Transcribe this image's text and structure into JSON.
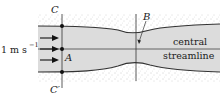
{
  "diagram": {
    "labels": {
      "top_section": "C",
      "bottom_section": "C′",
      "point_a": "A",
      "point_b": "B",
      "velocity": "1 m s",
      "velocity_exp": "−1",
      "central_line1": "central",
      "central_line2": "streamline"
    },
    "colors": {
      "fluid": "#dcdcdc",
      "wall": "#333333",
      "stipple": "#9a9a9a"
    },
    "arrows_count": 3
  }
}
